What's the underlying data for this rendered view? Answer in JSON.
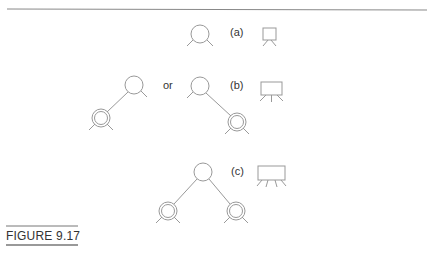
{
  "figure": {
    "caption": "FIGURE 9.17",
    "labels": {
      "a": "(a)",
      "b": "(b)",
      "c": "(c)",
      "or": "or"
    }
  },
  "colors": {
    "stroke": "#888888",
    "rule": "#777777",
    "text": "#333333"
  }
}
